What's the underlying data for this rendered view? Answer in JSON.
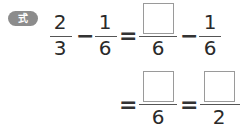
{
  "badge": {
    "label": "式"
  },
  "row1": {
    "frac1": {
      "numerator": "2",
      "denominator": "3"
    },
    "op1": "−",
    "frac2": {
      "numerator": "1",
      "denominator": "6"
    },
    "eq": "=",
    "frac3": {
      "numerator": "",
      "denominator": "6"
    },
    "op2": "−",
    "frac4": {
      "numerator": "1",
      "denominator": "6"
    }
  },
  "row2": {
    "eq1": "=",
    "frac5": {
      "numerator": "",
      "denominator": "6"
    },
    "eq2": "=",
    "frac6": {
      "numerator": "",
      "denominator": "2"
    }
  }
}
